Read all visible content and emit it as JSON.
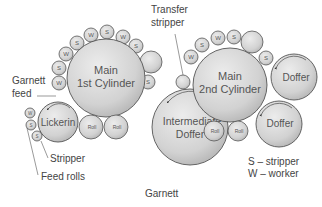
{
  "title": "Garnett",
  "labels": {
    "main_1st_line1": "Main",
    "main_1st_line2": "1st Cylinder",
    "main_2nd_line1": "Main",
    "main_2nd_line2": "2nd Cylinder",
    "intermediate_line1": "Intermediate",
    "intermediate_line2": "Doffer",
    "lickerin": "Lickerin",
    "doffer_top": "Doffer",
    "doffer_bottom": "Doffer",
    "roll": "Roll",
    "stripper_small": "S",
    "worker_small": "W"
  },
  "callouts": {
    "transfer_stripper_line1": "Transfer",
    "transfer_stripper_line2": "stripper",
    "garnett_feed_line1": "Garnett",
    "garnett_feed_line2": "feed",
    "stripper": "Stripper",
    "feed_rolls": "Feed rolls"
  },
  "legend": {
    "s": "S – stripper",
    "w": "W – worker"
  },
  "colors": {
    "circle_light": "#e6e6e6",
    "circle_dark": "#b8b8b8",
    "stroke": "#555555",
    "text": "#444444"
  }
}
